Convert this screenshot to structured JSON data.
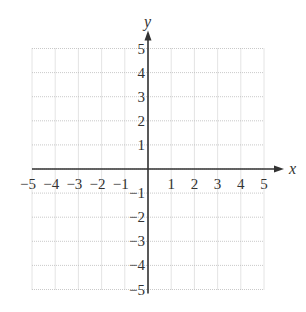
{
  "chart_data": {
    "type": "scatter",
    "title": "",
    "xlabel": "x",
    "ylabel": "y",
    "xlim": [
      -5,
      5
    ],
    "ylim": [
      -5,
      5
    ],
    "grid": true,
    "grid_style": "dotted",
    "x_ticks": [
      -5,
      -4,
      -3,
      -2,
      -1,
      1,
      2,
      3,
      4,
      5
    ],
    "y_ticks": [
      -5,
      -4,
      -3,
      -2,
      -1,
      1,
      2,
      3,
      4,
      5
    ],
    "x_tick_labels": [
      "−5",
      "−4",
      "−3",
      "−2",
      "−1",
      "1",
      "2",
      "3",
      "4",
      "5"
    ],
    "y_tick_labels": [
      "−5",
      "−4",
      "−3",
      "−2",
      "−1",
      "1",
      "2",
      "3",
      "4",
      "5"
    ],
    "series": [],
    "legend": null
  },
  "colors": {
    "axis": "#333333",
    "grid": "#bbbbbb",
    "text": "#333333",
    "background": "#ffffff"
  },
  "layout": {
    "origin_px": [
      148,
      169
    ],
    "unit_x_px": 23.2,
    "unit_y_px": 24.1
  }
}
